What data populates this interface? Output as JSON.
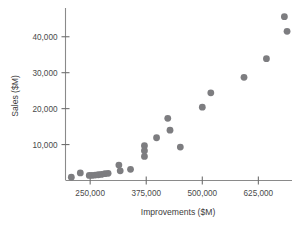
{
  "chart_data": {
    "type": "scatter",
    "title": "",
    "xlabel": "Improvements ($M)",
    "ylabel": "Sales ($M)",
    "xlim": [
      195000,
      700000
    ],
    "ylim": [
      0,
      48000
    ],
    "grid": false,
    "legend": null,
    "xticks": [
      250000,
      375000,
      500000,
      625000
    ],
    "xticklabels": [
      "250,000",
      "375,000",
      "500,000",
      "625,000"
    ],
    "yticks": [
      10000,
      20000,
      30000,
      40000
    ],
    "yticklabels": [
      "10,000",
      "20,000",
      "30,000",
      "40,000"
    ],
    "marker": "circle",
    "marker_color": "#7d7d80",
    "marker_size": 3.4,
    "points": [
      {
        "x": 208000,
        "y": 900
      },
      {
        "x": 228000,
        "y": 2100
      },
      {
        "x": 248000,
        "y": 1400
      },
      {
        "x": 254000,
        "y": 1400
      },
      {
        "x": 261000,
        "y": 1500
      },
      {
        "x": 268000,
        "y": 1600
      },
      {
        "x": 275000,
        "y": 1700
      },
      {
        "x": 283000,
        "y": 1900
      },
      {
        "x": 290000,
        "y": 2000
      },
      {
        "x": 314000,
        "y": 4300
      },
      {
        "x": 317000,
        "y": 2700
      },
      {
        "x": 340000,
        "y": 3100
      },
      {
        "x": 371000,
        "y": 9700
      },
      {
        "x": 371000,
        "y": 8300
      },
      {
        "x": 371000,
        "y": 6700
      },
      {
        "x": 398000,
        "y": 11900
      },
      {
        "x": 423000,
        "y": 17300
      },
      {
        "x": 428000,
        "y": 14000
      },
      {
        "x": 451000,
        "y": 9300
      },
      {
        "x": 500000,
        "y": 20400
      },
      {
        "x": 519000,
        "y": 24400
      },
      {
        "x": 593000,
        "y": 28700
      },
      {
        "x": 643000,
        "y": 33900
      },
      {
        "x": 683000,
        "y": 45600
      },
      {
        "x": 689000,
        "y": 41500
      }
    ]
  },
  "axes": {
    "x_title": "Improvements ($M)",
    "y_title": "Sales ($M)"
  }
}
